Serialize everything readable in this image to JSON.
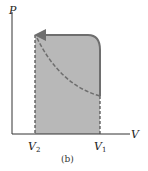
{
  "diagram": {
    "type": "pv-diagram",
    "y_axis_label": "P",
    "x_axis_label": "V",
    "tick_labels": [
      {
        "main": "V",
        "sub": "2"
      },
      {
        "main": "V",
        "sub": "1"
      }
    ],
    "caption": "(b)",
    "colors": {
      "shaded_region": "#b8b8b8",
      "process_path": "#6e6e6e",
      "axes": "#333333"
    }
  }
}
